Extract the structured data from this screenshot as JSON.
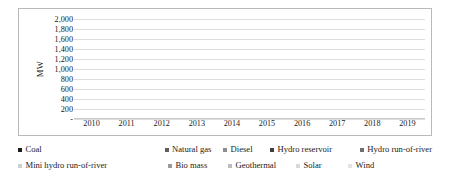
{
  "chart_data": {
    "type": "bar",
    "stacked": true,
    "title": "",
    "xlabel": "",
    "ylabel": "MW",
    "ylim": [
      0,
      2000
    ],
    "ytick_step": 200,
    "grid": true,
    "legend_position": "bottom",
    "zero_tick_label": "-",
    "categories": [
      "2010",
      "2011",
      "2012",
      "2013",
      "2014",
      "2015",
      "2016",
      "2017",
      "2018",
      "2019"
    ],
    "ytick_labels": [
      "2,000",
      "1,800",
      "1,600",
      "1,400",
      "1,200",
      "1,000",
      "800",
      "600",
      "400",
      "200",
      "-"
    ],
    "series": [
      {
        "name": "Coal",
        "color": "#1c1c1c",
        "values": [
          350,
          950,
          670,
          230,
          0,
          170,
          520,
          0,
          40,
          370
        ]
      },
      {
        "name": "Natural gas",
        "color": "#5e5e5e",
        "values": [
          0,
          0,
          0,
          40,
          0,
          50,
          0,
          0,
          0,
          0
        ]
      },
      {
        "name": "Diesel",
        "color": "#8c8c8c",
        "values": [
          230,
          520,
          120,
          70,
          450,
          120,
          550,
          0,
          0,
          300
        ]
      },
      {
        "name": "Hydro reservoir",
        "color": "#3f3f3f",
        "values": [
          0,
          0,
          0,
          20,
          0,
          20,
          60,
          0,
          0,
          0
        ]
      },
      {
        "name": "Hydro run-of-river",
        "color": "#6f6f6f",
        "values": [
          0,
          0,
          0,
          0,
          0,
          30,
          40,
          0,
          0,
          0
        ]
      },
      {
        "name": "Mini hydro run-of-river",
        "color": "#cfcfcf",
        "values": [
          130,
          30,
          80,
          80,
          730,
          480,
          730,
          890,
          820,
          390
        ]
      },
      {
        "name": "Bio mass",
        "color": "#9a9a9a",
        "values": [
          0,
          0,
          0,
          0,
          0,
          0,
          0,
          20,
          0,
          0
        ]
      },
      {
        "name": "Geothermal",
        "color": "#bcbcbc",
        "values": [
          0,
          0,
          0,
          0,
          0,
          0,
          0,
          0,
          0,
          0
        ]
      },
      {
        "name": "Solar",
        "color": "#d9d9d9",
        "values": [
          0,
          0,
          0,
          0,
          0,
          0,
          0,
          0,
          0,
          0
        ]
      },
      {
        "name": "Wind",
        "color": "#e3e3e3",
        "values": [
          0,
          0,
          0,
          0,
          0,
          0,
          0,
          0,
          0,
          0
        ]
      }
    ],
    "totals": [
      710,
      1500,
      870,
      440,
      1180,
      870,
      1900,
      910,
      860,
      1060
    ]
  },
  "legend": {
    "row1": [
      {
        "label": "Coal",
        "color": "#1c1c1c"
      },
      {
        "label": "Natural gas",
        "color": "#5e5e5e"
      },
      {
        "label": "Diesel",
        "color": "#8c8c8c"
      },
      {
        "label": "Hydro reservoir",
        "color": "#3f3f3f"
      },
      {
        "label": "Hydro run-of-river",
        "color": "#6f6f6f"
      }
    ],
    "row2": [
      {
        "label": "Mini hydro run-of-river",
        "color": "#cfcfcf"
      },
      {
        "label": "Bio mass",
        "color": "#9a9a9a"
      },
      {
        "label": "Geothermal",
        "color": "#bcbcbc"
      },
      {
        "label": "Solar",
        "color": "#d9d9d9"
      },
      {
        "label": "Wind",
        "color": "#e3e3e3"
      }
    ]
  }
}
